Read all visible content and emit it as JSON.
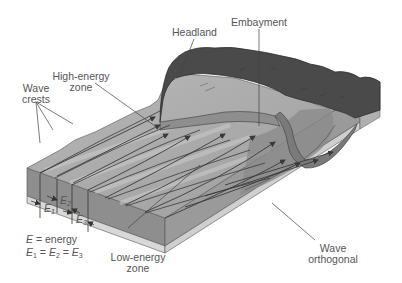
{
  "figure": {
    "labels": {
      "headland": "Headland",
      "embayment": "Embayment",
      "high_energy_zone": [
        "High-energy",
        "zone"
      ],
      "wave_crests": [
        "Wave",
        "crests"
      ],
      "low_energy_zone": [
        "Low-energy",
        "zone"
      ],
      "wave_orthogonal": [
        "Wave",
        "orthogonal"
      ]
    },
    "energy_marks": {
      "e1": {
        "base": "E",
        "sub": "1"
      },
      "e2": {
        "base": "E",
        "sub": "2"
      },
      "e3": {
        "base": "E",
        "sub": "3"
      }
    },
    "legend": {
      "line1": {
        "symbol": "E",
        "text": " = energy"
      },
      "line2": {
        "parts": [
          "E",
          "1",
          " = ",
          "E",
          "2",
          " = ",
          "E",
          "3"
        ]
      }
    },
    "colors": {
      "water_surface": "#a9a9a9",
      "water_light": "#c4c4c4",
      "block_side_dark": "#8e8e8e",
      "block_side_light": "#cfcfcf",
      "bedrock_strip": "#d8d8d8",
      "land": "#4a4a4a",
      "land_edge": "#2e2e2e",
      "lines": "#3a3a3a",
      "label_text": "#555555"
    }
  }
}
